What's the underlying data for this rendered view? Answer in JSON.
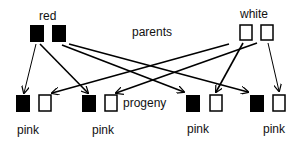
{
  "labels": {
    "red": "red",
    "white": "white",
    "parents": "parents",
    "progeny": "progeny",
    "pink1": "pink",
    "pink2": "pink",
    "pink3": "pink",
    "pink4": "pink"
  },
  "colors": {
    "filled": "#000000",
    "outline": "#000000",
    "background": "#ffffff"
  }
}
